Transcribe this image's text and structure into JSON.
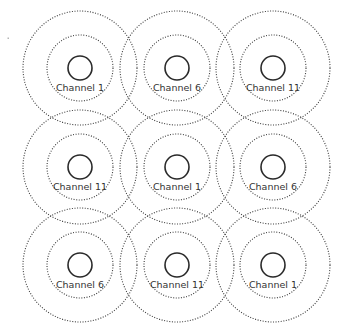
{
  "diagram": {
    "type": "wifi-channel-reuse-grid",
    "geometry": {
      "columns_x": [
        80,
        177,
        273
      ],
      "rows_y": [
        68,
        167,
        265
      ],
      "outer_radius": 57,
      "inner_radius": 33,
      "ap_radius": 12,
      "label_offset_y": 23
    },
    "colors": {
      "background": "#ffffff",
      "stroke": "#3a3a3a",
      "text": "#333333"
    },
    "cells": [
      {
        "row": 0,
        "col": 0,
        "label": "Channel 1"
      },
      {
        "row": 0,
        "col": 1,
        "label": "Channel 6"
      },
      {
        "row": 0,
        "col": 2,
        "label": "Channel 11"
      },
      {
        "row": 1,
        "col": 0,
        "label": "Channel 11"
      },
      {
        "row": 1,
        "col": 1,
        "label": "Channel 1"
      },
      {
        "row": 1,
        "col": 2,
        "label": "Channel 6"
      },
      {
        "row": 2,
        "col": 0,
        "label": "Channel 6"
      },
      {
        "row": 2,
        "col": 1,
        "label": "Channel 11"
      },
      {
        "row": 2,
        "col": 2,
        "label": "Channel 1"
      }
    ]
  }
}
